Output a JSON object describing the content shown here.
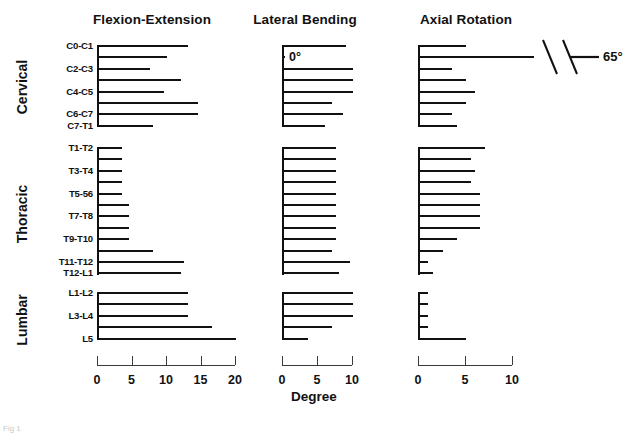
{
  "figure": {
    "axis_caption": "Degree",
    "corner_mark": "Fig 1"
  },
  "groups": [
    {
      "id": "cervical",
      "label": "Cervical"
    },
    {
      "id": "thoracic",
      "label": "Thoracic"
    },
    {
      "id": "lumbar",
      "label": "Lumbar"
    }
  ],
  "row_labels": [
    "C0-C1",
    "",
    "C2-C3",
    "",
    "C4-C5",
    "",
    "C6-C7",
    "C7-T1",
    "T1-T2",
    "",
    "T3-T4",
    "",
    "T5-56",
    "",
    "T7-T8",
    "",
    "T9-T10",
    "",
    "T11-T12",
    "T12-L1",
    "L1-L2",
    "",
    "L3-L4",
    "",
    "L5"
  ],
  "annotations": {
    "zero_degree": "0°",
    "break_value": "65°"
  },
  "chart_data": {
    "type": "bar",
    "title": "",
    "xlabel": "Degree",
    "ylabel": "",
    "grid": false,
    "legend": "none",
    "orientation": "horizontal",
    "levels": [
      "C0-C1",
      "C1-C2",
      "C2-C3",
      "C3-C4",
      "C4-C5",
      "C5-C6",
      "C6-C7",
      "C7-T1",
      "T1-T2",
      "T2-T3",
      "T3-T4",
      "T4-T5",
      "T5-T6",
      "T6-T7",
      "T7-T8",
      "T8-T9",
      "T9-T10",
      "T10-T11",
      "T11-T12",
      "T12-L1",
      "L1-L2",
      "L2-L3",
      "L3-L4",
      "L4-L5",
      "L5"
    ],
    "group_ranges": {
      "cervical": [
        0,
        7
      ],
      "thoracic": [
        8,
        19
      ],
      "lumbar": [
        20,
        24
      ]
    },
    "panels": [
      {
        "name": "Flexion-Extension",
        "xlim": [
          0,
          20
        ],
        "ticks": [
          0,
          5,
          10,
          15,
          20
        ],
        "values": [
          13.0,
          10.0,
          7.5,
          12.0,
          9.5,
          14.5,
          14.5,
          8.0,
          3.5,
          3.5,
          3.5,
          3.5,
          3.5,
          4.5,
          4.5,
          4.5,
          4.5,
          8.0,
          12.5,
          12.0,
          13.0,
          13.0,
          13.0,
          16.5,
          20.0
        ]
      },
      {
        "name": "Lateral Bending",
        "xlim": [
          0,
          10
        ],
        "ticks": [
          0,
          5,
          10
        ],
        "values": [
          9.0,
          0.0,
          10.0,
          10.0,
          10.0,
          7.0,
          8.5,
          6.0,
          7.5,
          7.5,
          7.5,
          7.5,
          7.5,
          7.5,
          7.5,
          7.5,
          7.5,
          7.0,
          9.5,
          8.0,
          10.0,
          10.0,
          10.0,
          7.0,
          3.5
        ]
      },
      {
        "name": "Axial Rotation",
        "xlim": [
          0,
          10
        ],
        "ticks": [
          0,
          5,
          10
        ],
        "values": [
          5.0,
          65.0,
          3.5,
          5.0,
          6.0,
          5.0,
          3.5,
          4.0,
          7.0,
          5.5,
          6.0,
          5.5,
          6.5,
          6.5,
          6.5,
          6.5,
          4.0,
          2.5,
          1.0,
          1.5,
          1.0,
          1.0,
          1.0,
          1.0,
          5.0
        ]
      }
    ]
  }
}
